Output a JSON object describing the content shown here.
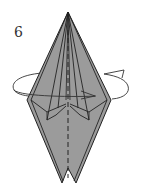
{
  "diagram": {
    "step_number": "6",
    "instruction": "turn-over",
    "colors": {
      "paper_fill": "#9b9b9b",
      "line": "#222222",
      "arrow": "#333333",
      "background": "#ffffff"
    }
  }
}
